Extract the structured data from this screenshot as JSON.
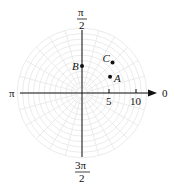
{
  "diagram": {
    "type": "polar_plot",
    "colors": {
      "axis": "#111111",
      "grid": "#e6e6e6",
      "point": "#111111",
      "background": "#ffffff"
    },
    "angle_labels": {
      "zero": "0",
      "half_pi": "π/2",
      "half_pi_num": "π",
      "half_pi_den": "2",
      "pi": "π",
      "three_half_pi_num": "3π",
      "three_half_pi_den": "2"
    },
    "radial_ticks": [
      {
        "value": 5,
        "label": "5"
      },
      {
        "value": 10,
        "label": "10"
      }
    ],
    "grid": {
      "rings": 12,
      "spoke_step_deg": 15
    },
    "points": [
      {
        "label": "A",
        "r": 6,
        "theta": "π/6"
      },
      {
        "label": "B",
        "r": 5,
        "theta": "π/2"
      },
      {
        "label": "C",
        "r": 8,
        "theta": "π/4"
      }
    ]
  },
  "chart_data": {
    "type": "scatter",
    "coordinate_system": "polar",
    "title": "",
    "axis_labels": [
      "0",
      "π/2",
      "π",
      "3π/2"
    ],
    "radial_tick_labels": [
      "5",
      "10"
    ],
    "rlim": [
      0,
      12
    ],
    "grid": true,
    "points": [
      {
        "name": "A",
        "r": 6,
        "theta_rad": 0.5236,
        "theta_label": "π/6"
      },
      {
        "name": "B",
        "r": 5,
        "theta_rad": 1.5708,
        "theta_label": "π/2"
      },
      {
        "name": "C",
        "r": 8,
        "theta_rad": 0.7854,
        "theta_label": "π/4"
      }
    ]
  }
}
